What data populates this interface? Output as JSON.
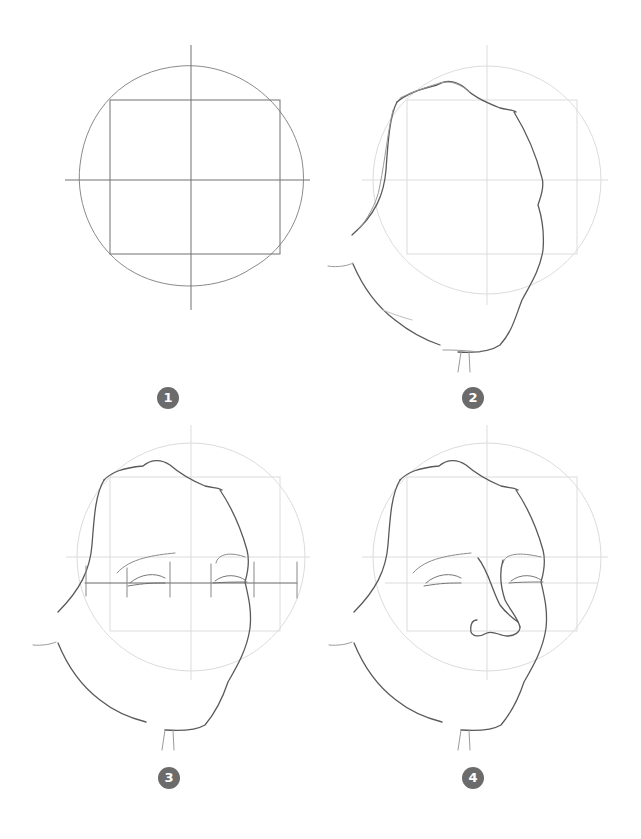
{
  "page": {
    "colors": {
      "background": "#ffffff",
      "badge": "#6b6b6b",
      "guide_dark": "#707070",
      "guide_light": "#d8d8d8",
      "stroke": "#555555"
    }
  },
  "steps": [
    {
      "number": "1",
      "caption": "Circle with cross guides and inscribed square"
    },
    {
      "number": "2",
      "caption": "Face outline over faded guides"
    },
    {
      "number": "3",
      "caption": "Brows, eyes and eye-width measuring line"
    },
    {
      "number": "4",
      "caption": "Nose added"
    }
  ]
}
